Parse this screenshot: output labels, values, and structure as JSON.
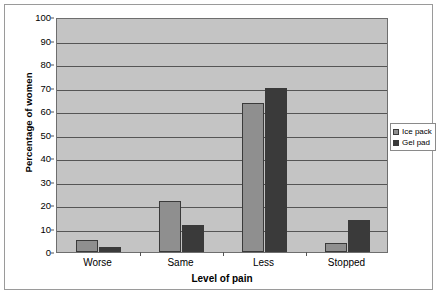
{
  "chart_data": {
    "type": "bar",
    "title": "",
    "xlabel": "Level of pain",
    "ylabel": "Percentage of women",
    "categories": [
      "Worse",
      "Same",
      "Less",
      "Stopped"
    ],
    "series": [
      {
        "name": "Ice pack",
        "color": "#8f8f8f",
        "values": [
          5,
          21.5,
          63.5,
          4
        ]
      },
      {
        "name": "Gel pad",
        "color": "#3a3a3a",
        "values": [
          2,
          11.5,
          70,
          13.5
        ]
      }
    ],
    "ylim": [
      0,
      100
    ],
    "ytick_step": 10,
    "yticks": [
      0,
      10,
      20,
      30,
      40,
      50,
      60,
      70,
      80,
      90,
      100
    ],
    "grid": true,
    "legend_position": "right",
    "plot_background": "#c4c4c4"
  },
  "legend": {
    "items": [
      {
        "label": "Ice pack"
      },
      {
        "label": "Gel pad"
      }
    ]
  }
}
